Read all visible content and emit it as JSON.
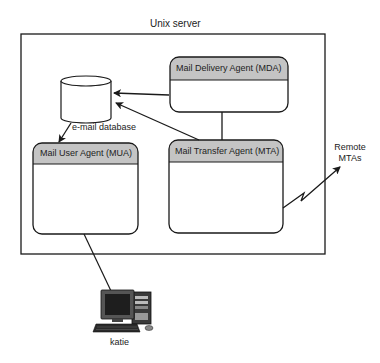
{
  "diagram": {
    "server": {
      "label": "Unix server"
    },
    "database": {
      "label": "e-mail database"
    },
    "mda": {
      "label": "Mail Delivery Agent (MDA)"
    },
    "mua": {
      "label": "Mail User Agent (MUA)"
    },
    "mta": {
      "label": "Mail Transfer Agent (MTA)"
    },
    "remote": {
      "line1": "Remote",
      "line2": "MTAs"
    },
    "client": {
      "label": "katie"
    }
  },
  "colors": {
    "stroke": "#1a1a1a",
    "header_fill": "#c4c4c4",
    "background": "#ffffff"
  }
}
